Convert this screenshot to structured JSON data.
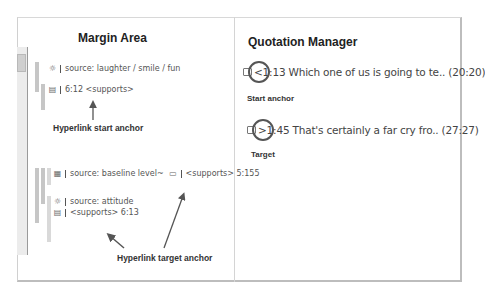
{
  "margin_area": {
    "title": "Margin Area",
    "codes": [
      {
        "icon": "gear-icon",
        "glyph": "☼",
        "text": "source: laughter / smile / fun"
      },
      {
        "icon": "memo-icon",
        "glyph": "▤",
        "text": "6:12 <supports>"
      },
      {
        "icon": "group-icon",
        "glyph": "▦",
        "text": "source: baseline level~",
        "link_icon": "quotation-icon",
        "link_glyph": "▭",
        "link_text": "<supports> 5:155"
      },
      {
        "icon": "gear-icon",
        "glyph": "☼",
        "text": "source: attitude"
      },
      {
        "icon": "memo-icon",
        "glyph": "▤",
        "text": "<supports> 6:13"
      }
    ],
    "annotations": {
      "start_anchor": "Hyperlink start anchor",
      "target_anchor": "Hyperlink target anchor"
    }
  },
  "quotation_manager": {
    "title": "Quotation Manager",
    "quotes": [
      {
        "marker": "<",
        "text": "<1:13 Which one of us is going to te.. (20:20)",
        "label": "Start anchor"
      },
      {
        "marker": ">",
        "text": ">1:45 That's certainly a far cry fro.. (27:27)",
        "label": "Target"
      }
    ]
  },
  "colors": {
    "bar": "#c6c6c6",
    "border": "#bdbdbd",
    "text": "#333333",
    "arrow": "#555555"
  }
}
